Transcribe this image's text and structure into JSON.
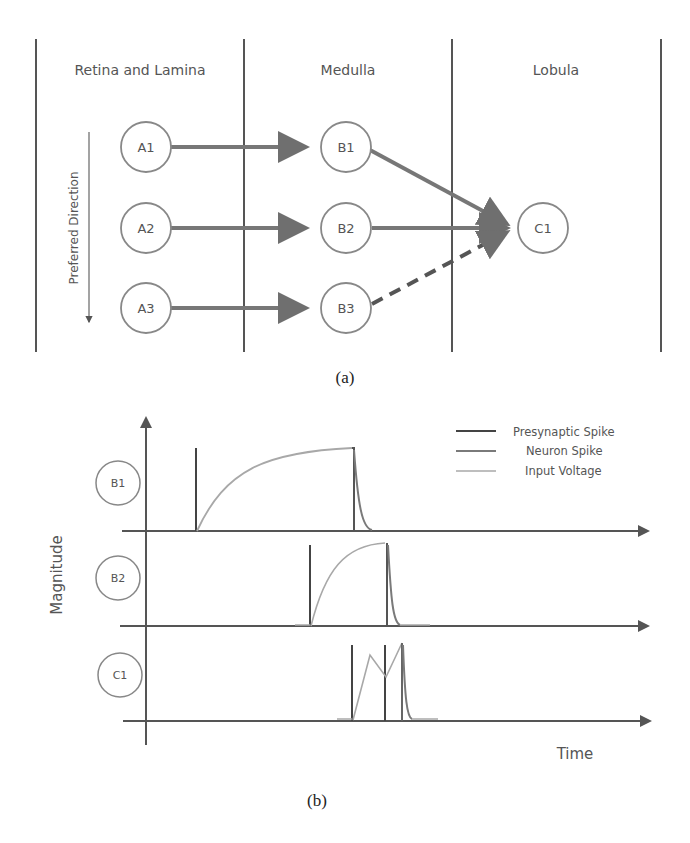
{
  "panel_a": {
    "caption": "(a)",
    "columns": [
      {
        "label": "Retina and Lamina"
      },
      {
        "label": "Medulla"
      },
      {
        "label": "Lobula"
      }
    ],
    "direction_label": "Preferred Direction",
    "nodes": {
      "A1": "A1",
      "A2": "A2",
      "A3": "A3",
      "B1": "B1",
      "B2": "B2",
      "B3": "B3",
      "C1": "C1"
    },
    "edges": [
      {
        "from": "A1",
        "to": "B1",
        "style": "solid"
      },
      {
        "from": "A2",
        "to": "B2",
        "style": "solid"
      },
      {
        "from": "A3",
        "to": "B3",
        "style": "solid"
      },
      {
        "from": "B1",
        "to": "C1",
        "style": "solid"
      },
      {
        "from": "B2",
        "to": "C1",
        "style": "solid"
      },
      {
        "from": "B3",
        "to": "C1",
        "style": "dashed"
      }
    ]
  },
  "panel_b": {
    "caption": "(b)",
    "y_axis_label": "Magnitude",
    "x_axis_label": "Time",
    "rows": [
      {
        "label": "B1"
      },
      {
        "label": "B2"
      },
      {
        "label": "C1"
      }
    ],
    "legend": [
      {
        "label": "Presynaptic Spike",
        "color": "#444444"
      },
      {
        "label": "Neuron Spike",
        "color": "#7a7a7a"
      },
      {
        "label": "Input Voltage",
        "color": "#a8a8a8"
      }
    ]
  },
  "colors": {
    "axis": "#555555",
    "arrow": "#777777",
    "node_stroke": "#888888",
    "presynaptic": "#444444",
    "neuron_spike": "#7a7a7a",
    "input_voltage": "#a8a8a8"
  }
}
